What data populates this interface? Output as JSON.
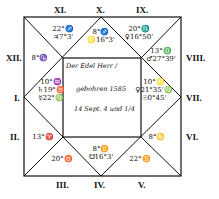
{
  "chart": {
    "center_text": {
      "line1": "Der Edel Herr /",
      "line2": "gebohren 1585",
      "line3": "14 Sept. 4 und 1/4"
    },
    "house_labels": {
      "I": "I.",
      "II": "II.",
      "III": "III.",
      "IV": "IV.",
      "V": "V.",
      "VI": "VI.",
      "VII": "VII.",
      "VIII": "VIII.",
      "IX": "IX.",
      "X": "X.",
      "XI": "XI.",
      "XII": "XII."
    },
    "houses": {
      "X": {
        "cusp": "8°♐",
        "planet": "♌16°3'"
      },
      "XI": {
        "cusp": "22°♐",
        "planet": "♃7°3'"
      },
      "IX": {
        "cusp": "20°♏",
        "planet": "♀16°50'"
      },
      "XII": {
        "cusp": "8°♑"
      },
      "VIII": {
        "cusp": "13°♎",
        "planet": "♂27°39'"
      },
      "I": {
        "cusp": "10°♒",
        "planet1": "♄19°♉",
        "planet2": "☿22°♍"
      },
      "VII": {
        "cusp": "10°♌",
        "planet1": "♀21°35'♍",
        "planet2": "☉0°45'"
      },
      "II": {
        "cusp": "13°♈"
      },
      "VI": {
        "cusp": "8°♋"
      },
      "III": {
        "cusp": "20°♉"
      },
      "IV": {
        "cusp": "8°♊",
        "planet": "☋16°3'"
      },
      "V": {
        "cusp": "22°♊"
      }
    }
  }
}
